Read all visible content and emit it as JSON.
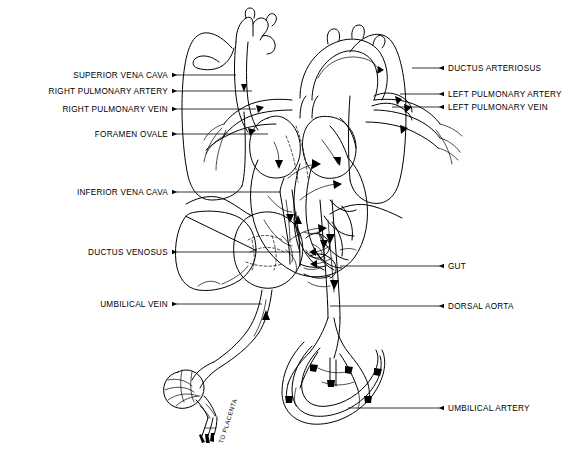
{
  "figure": {
    "background_color": "#ffffff",
    "line_color": "#000000",
    "width": 585,
    "height": 464
  },
  "labels_left": [
    {
      "id": "superior-vena-cava",
      "text": "SUPERIOR VENA CAVA",
      "text_x": 168,
      "text_y": 71,
      "line_x1": 172,
      "line_x2": 236,
      "line_y": 75
    },
    {
      "id": "right-pulmonary-artery",
      "text": "RIGHT PULMONARY ARTERY",
      "text_x": 168,
      "text_y": 87,
      "line_x1": 172,
      "line_x2": 252,
      "line_y": 91
    },
    {
      "id": "right-pulmonary-vein",
      "text": "RIGHT PULMONARY VEIN",
      "text_x": 168,
      "text_y": 105,
      "line_x1": 172,
      "line_x2": 256,
      "line_y": 109
    },
    {
      "id": "foramen-ovale",
      "text": "FORAMEN OVALE",
      "text_x": 168,
      "text_y": 130,
      "line_x1": 172,
      "line_x2": 268,
      "line_y": 134
    },
    {
      "id": "inferior-vena-cava",
      "text": "INFERIOR VENA CAVA",
      "text_x": 168,
      "text_y": 188,
      "line_x1": 172,
      "line_x2": 280,
      "line_y": 192
    },
    {
      "id": "ductus-venosus",
      "text": "DUCTUS VENOSUS",
      "text_x": 168,
      "text_y": 248,
      "line_x1": 172,
      "line_x2": 300,
      "line_y": 252
    },
    {
      "id": "umbilical-vein",
      "text": "UMBILICAL VEIN",
      "text_x": 168,
      "text_y": 300,
      "line_x1": 172,
      "line_x2": 262,
      "line_y": 304
    }
  ],
  "labels_right": [
    {
      "id": "ductus-arteriosus",
      "text": "DUCTUS ARTERIOSUS",
      "text_x": 448,
      "text_y": 64,
      "line_x1": 412,
      "line_x2": 444,
      "line_y": 68
    },
    {
      "id": "left-pulmonary-artery",
      "text": "LEFT PULMONARY ARTERY",
      "text_x": 448,
      "text_y": 90,
      "line_x1": 400,
      "line_x2": 444,
      "line_y": 94
    },
    {
      "id": "left-pulmonary-vein",
      "text": "LEFT PULMONARY VEIN",
      "text_x": 448,
      "text_y": 103,
      "line_x1": 392,
      "line_x2": 444,
      "line_y": 107
    },
    {
      "id": "gut",
      "text": "GUT",
      "text_x": 448,
      "text_y": 262,
      "line_x1": 340,
      "line_x2": 444,
      "line_y": 266
    },
    {
      "id": "dorsal-aorta",
      "text": "DORSAL AORTA",
      "text_x": 448,
      "text_y": 302,
      "line_x1": 330,
      "line_x2": 444,
      "line_y": 306
    },
    {
      "id": "umbilical-artery",
      "text": "UMBILICAL ARTERY",
      "text_x": 448,
      "text_y": 404,
      "line_x1": 348,
      "line_x2": 444,
      "line_y": 408
    }
  ],
  "annotations": [
    {
      "id": "to-placenta",
      "text": "TO PLACENTA",
      "x": 214,
      "y": 440
    }
  ],
  "structures": [
    "right-lung",
    "left-lung",
    "heart",
    "aortic-arch",
    "ductus-arteriosus-vessel",
    "superior-vena-cava-vessel",
    "inferior-vena-cava-vessel",
    "foramen-ovale-opening",
    "liver",
    "ductus-venosus-vessel",
    "umbilical-vein-vessel",
    "gut-loops",
    "dorsal-aorta-vessel",
    "umbilical-arteries",
    "umbilical-cord",
    "placenta-end"
  ]
}
